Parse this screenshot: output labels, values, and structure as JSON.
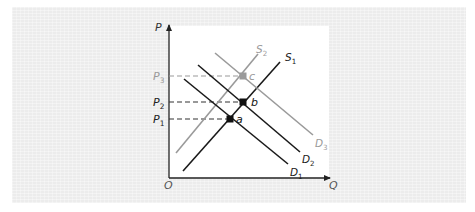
{
  "chart_data": {
    "type": "line",
    "title": "",
    "xlabel": "Q",
    "ylabel": "P",
    "origin_label": "O",
    "grid": false,
    "series": [
      {
        "name": "S1",
        "label": "S",
        "sub": "1",
        "color": "#1a1a1a",
        "x1": 183,
        "y1": 171,
        "x2": 280,
        "y2": 62,
        "label_x": 285,
        "label_y": 61
      },
      {
        "name": "S2",
        "label": "S",
        "sub": "2",
        "color": "#9a9a9a",
        "x1": 176,
        "y1": 153,
        "x2": 258,
        "y2": 54,
        "label_x": 256,
        "label_y": 53
      },
      {
        "name": "D1",
        "label": "D",
        "sub": "1",
        "color": "#1a1a1a",
        "x1": 184,
        "y1": 79,
        "x2": 288,
        "y2": 164,
        "label_x": 290,
        "label_y": 176
      },
      {
        "name": "D2",
        "label": "D",
        "sub": "2",
        "color": "#1a1a1a",
        "x1": 198,
        "y1": 65,
        "x2": 300,
        "y2": 152,
        "label_x": 302,
        "label_y": 163
      },
      {
        "name": "D3",
        "label": "D",
        "sub": "3",
        "color": "#9a9a9a",
        "x1": 215,
        "y1": 53,
        "x2": 313,
        "y2": 135,
        "label_x": 315,
        "label_y": 147
      }
    ],
    "equilibria": [
      {
        "name": "a",
        "label": "a",
        "x": 230,
        "y": 119,
        "color": "#111111",
        "price_label": "P",
        "price_sub": "1",
        "price_color": "#222222",
        "dash_color": "#333333"
      },
      {
        "name": "b",
        "label": "b",
        "x": 243,
        "y": 102,
        "color": "#111111",
        "price_label": "P",
        "price_sub": "2",
        "price_color": "#222222",
        "dash_color": "#333333"
      },
      {
        "name": "c",
        "label": "c",
        "x": 243,
        "y": 76,
        "color": "#9a9a9a",
        "price_label": "P",
        "price_sub": "3",
        "price_color": "#9a9a9a",
        "dash_color": "#9a9a9a"
      }
    ],
    "axes": {
      "origin_x": 169,
      "origin_y": 178,
      "x_end": 333,
      "y_end": 22
    }
  }
}
